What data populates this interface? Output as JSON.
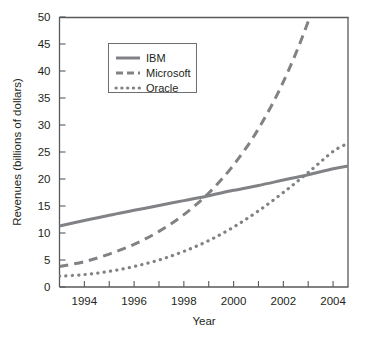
{
  "chart_data": {
    "type": "line",
    "title": "",
    "xlabel": "Year",
    "ylabel": "Revenues (billions of dollars)",
    "xlim": [
      1993.0,
      2004.6
    ],
    "ylim": [
      0,
      50
    ],
    "grid": false,
    "legend_position": "top-left inside",
    "x_ticks_major": [
      1994,
      1996,
      1998,
      2000,
      2002,
      2004
    ],
    "x_ticks_major_labels": [
      "1994",
      "1996",
      "1998",
      "2000",
      "2002",
      "2004"
    ],
    "x_ticks_minor": [
      1995,
      1997,
      1999,
      2001,
      2003
    ],
    "y_ticks": [
      0,
      5,
      10,
      15,
      20,
      25,
      30,
      35,
      40,
      45,
      50
    ],
    "y_tick_labels": [
      "0",
      "5",
      "10",
      "15",
      "20",
      "25",
      "30",
      "35",
      "40",
      "45",
      "50"
    ],
    "x": [
      1993.0,
      1994,
      1995,
      1996,
      1997,
      1998,
      1999,
      2000,
      2001,
      2002,
      2003,
      2004,
      2004.6
    ],
    "series": [
      {
        "name": "IBM",
        "style": "solid",
        "color": "#808285",
        "values": [
          11.3,
          12.3,
          13.3,
          14.2,
          15.1,
          16.0,
          16.9,
          17.9,
          18.8,
          19.8,
          20.8,
          21.9,
          22.4
        ]
      },
      {
        "name": "Microsoft",
        "style": "dashed",
        "color": "#808285",
        "values": [
          3.8,
          4.7,
          6.1,
          7.9,
          10.3,
          13.4,
          17.4,
          22.6,
          29.3,
          38.0,
          49.2,
          63.7,
          72.5
        ],
        "note": "exits top of plot above 50 near 2003.1"
      },
      {
        "name": "Oracle",
        "style": "dotted",
        "color": "#808285",
        "values": [
          2.0,
          2.3,
          2.9,
          3.8,
          5.0,
          6.6,
          8.6,
          11.1,
          14.1,
          17.5,
          21.2,
          25.1,
          26.6
        ]
      }
    ],
    "annotations": [
      {
        "text": "Microsoft crosses IBM",
        "x": 1997.7,
        "y": 15.1
      },
      {
        "text": "Oracle crosses IBM",
        "x": 2001.6,
        "y": 19.3
      }
    ]
  },
  "legend": {
    "items": [
      {
        "label": "IBM",
        "style": "solid"
      },
      {
        "label": "Microsoft",
        "style": "dashed"
      },
      {
        "label": "Oracle",
        "style": "dotted"
      }
    ]
  }
}
